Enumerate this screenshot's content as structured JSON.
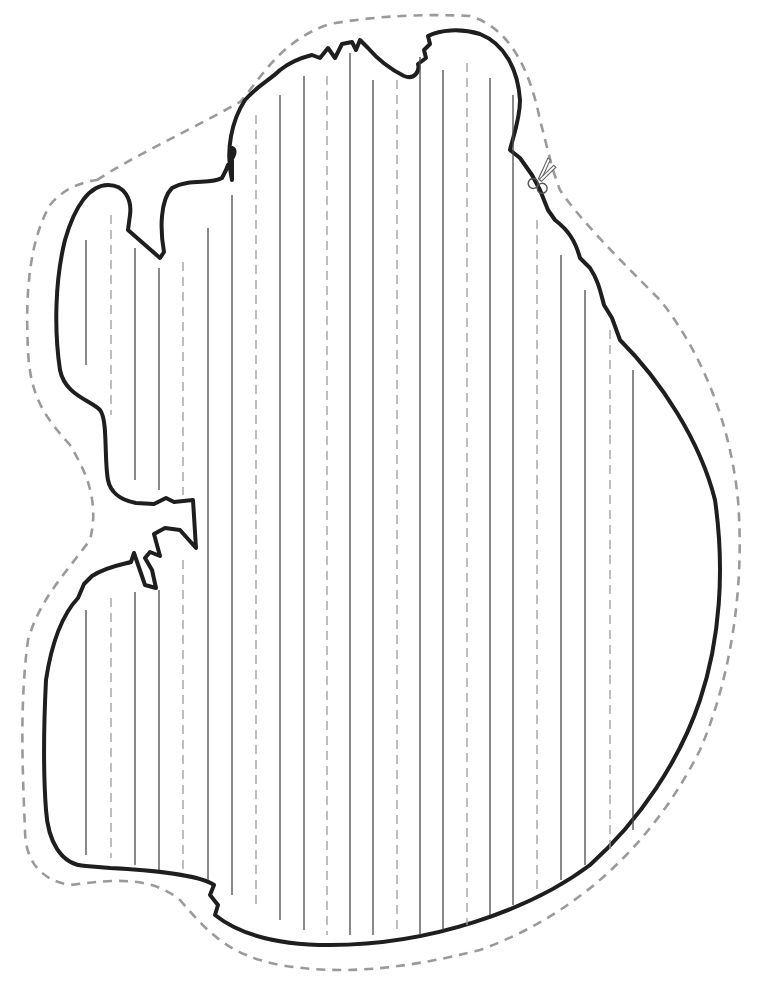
{
  "page": {
    "kind": "printable writing template",
    "width": 767,
    "height": 994
  },
  "colors": {
    "outline": "#1e1e1e",
    "cut_line": "#9a9a9a",
    "guide_solid": "#4a4a4a",
    "guide_dashed": "#9c9c9c",
    "background": "#ffffff"
  },
  "icons": {
    "scissors": "scissors-icon"
  },
  "guide_lines": [
    {
      "x": 86,
      "y1": 240,
      "y2": 365,
      "style": "solid"
    },
    {
      "x": 86,
      "y1": 610,
      "y2": 855,
      "style": "solid"
    },
    {
      "x": 111,
      "y1": 215,
      "y2": 415,
      "style": "dashed"
    },
    {
      "x": 111,
      "y1": 598,
      "y2": 858,
      "style": "dashed"
    },
    {
      "x": 135,
      "y1": 248,
      "y2": 480,
      "style": "solid"
    },
    {
      "x": 135,
      "y1": 592,
      "y2": 865,
      "style": "solid"
    },
    {
      "x": 159,
      "y1": 268,
      "y2": 490,
      "style": "solid"
    },
    {
      "x": 159,
      "y1": 590,
      "y2": 870,
      "style": "solid"
    },
    {
      "x": 183,
      "y1": 262,
      "y2": 495,
      "style": "dashed"
    },
    {
      "x": 183,
      "y1": 560,
      "y2": 875,
      "style": "dashed"
    },
    {
      "x": 208,
      "y1": 228,
      "y2": 880,
      "style": "solid"
    },
    {
      "x": 232,
      "y1": 195,
      "y2": 895,
      "style": "solid"
    },
    {
      "x": 256,
      "y1": 115,
      "y2": 910,
      "style": "dashed"
    },
    {
      "x": 280,
      "y1": 95,
      "y2": 920,
      "style": "solid"
    },
    {
      "x": 304,
      "y1": 76,
      "y2": 930,
      "style": "solid"
    },
    {
      "x": 327,
      "y1": 76,
      "y2": 935,
      "style": "dashed"
    },
    {
      "x": 350,
      "y1": 53,
      "y2": 935,
      "style": "solid"
    },
    {
      "x": 373,
      "y1": 80,
      "y2": 935,
      "style": "solid"
    },
    {
      "x": 397,
      "y1": 80,
      "y2": 935,
      "style": "dashed"
    },
    {
      "x": 420,
      "y1": 57,
      "y2": 935,
      "style": "solid"
    },
    {
      "x": 443,
      "y1": 70,
      "y2": 930,
      "style": "solid"
    },
    {
      "x": 467,
      "y1": 63,
      "y2": 925,
      "style": "dashed"
    },
    {
      "x": 490,
      "y1": 78,
      "y2": 915,
      "style": "solid"
    },
    {
      "x": 513,
      "y1": 95,
      "y2": 905,
      "style": "solid"
    },
    {
      "x": 537,
      "y1": 220,
      "y2": 895,
      "style": "dashed"
    },
    {
      "x": 561,
      "y1": 255,
      "y2": 880,
      "style": "solid"
    },
    {
      "x": 585,
      "y1": 290,
      "y2": 865,
      "style": "solid"
    },
    {
      "x": 610,
      "y1": 330,
      "y2": 850,
      "style": "dashed"
    },
    {
      "x": 633,
      "y1": 370,
      "y2": 830,
      "style": "solid"
    }
  ]
}
